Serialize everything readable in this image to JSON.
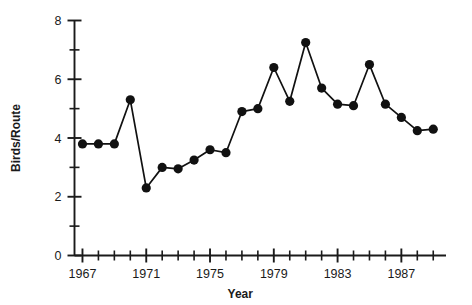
{
  "chart_data": {
    "type": "line",
    "title": "",
    "xlabel": "Year",
    "ylabel": "Birds/Route",
    "xlim": [
      1966.5,
      1989.8
    ],
    "ylim": [
      0,
      8
    ],
    "grid": false,
    "legend": null,
    "marker": "filled-circle",
    "line_style": "solid",
    "color": "#111111",
    "x": [
      1967,
      1968,
      1969,
      1970,
      1971,
      1972,
      1973,
      1974,
      1975,
      1976,
      1977,
      1978,
      1979,
      1980,
      1981,
      1982,
      1983,
      1984,
      1985,
      1986,
      1987,
      1988,
      1989
    ],
    "values": [
      3.8,
      3.8,
      3.8,
      5.3,
      2.3,
      3.0,
      2.95,
      3.25,
      3.6,
      3.5,
      4.9,
      5.0,
      6.4,
      5.25,
      7.25,
      5.7,
      5.15,
      5.1,
      6.5,
      5.15,
      4.7,
      4.25,
      4.3
    ],
    "series": [
      {
        "name": "Birds/Route",
        "values": [
          3.8,
          3.8,
          3.8,
          5.3,
          2.3,
          3.0,
          2.95,
          3.25,
          3.6,
          3.5,
          4.9,
          5.0,
          6.4,
          5.25,
          7.25,
          5.7,
          5.15,
          5.1,
          6.5,
          5.15,
          4.7,
          4.25,
          4.3
        ]
      }
    ],
    "y_ticks_major": [
      0,
      2,
      4,
      6,
      8
    ],
    "y_tick_labels": [
      "0",
      "2",
      "4",
      "6",
      "8"
    ],
    "y_ticks_minor": [
      1,
      3,
      5,
      7
    ],
    "x_ticks_major": [
      1967,
      1971,
      1975,
      1979,
      1983,
      1987
    ],
    "x_tick_labels": [
      "1967",
      "1971",
      "1975",
      "1979",
      "1983",
      "1987"
    ],
    "x_ticks_minor": [
      1968,
      1969,
      1970,
      1972,
      1973,
      1974,
      1976,
      1977,
      1978,
      1980,
      1981,
      1982,
      1984,
      1985,
      1986,
      1988,
      1989
    ]
  }
}
